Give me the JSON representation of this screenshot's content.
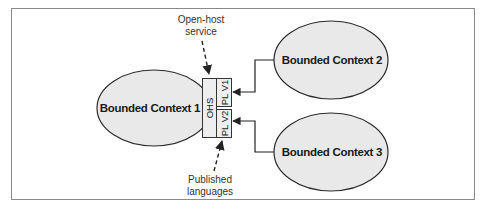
{
  "diagram": {
    "contexts": [
      {
        "id": "bc1",
        "label": "Bounded Context 1"
      },
      {
        "id": "bc2",
        "label": "Bounded Context 2"
      },
      {
        "id": "bc3",
        "label": "Bounded Context 3"
      }
    ],
    "ohs": {
      "label": "OHS",
      "languages": [
        {
          "label": "PL V1"
        },
        {
          "label": "PL V2"
        }
      ]
    },
    "annotations": {
      "open_host": {
        "line1": "Open-host",
        "line2": "service"
      },
      "published": {
        "line1": "Published",
        "line2": "languages"
      }
    },
    "colors": {
      "ellipse_fill": "#e9e9e9",
      "stroke": "#222222",
      "frame": "#8a8a8a"
    }
  }
}
